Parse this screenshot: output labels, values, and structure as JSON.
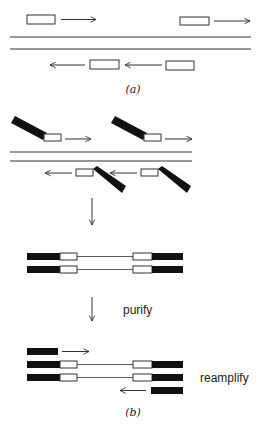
{
  "figure": {
    "panel_a": {
      "label": "(a)",
      "description": "Primers (open boxes) with arrows annealing to both strands of double-stranded DNA"
    },
    "panel_b": {
      "label": "(b)",
      "step_purify": "purify",
      "step_reamplify": "reamplify",
      "description": "Tailed primers (open box with black tail) anneal, product purified, then reamplified with tail primers"
    }
  },
  "colors": {
    "stroke": "#333333",
    "tail_fill": "#111111",
    "primer_fill": "#ffffff",
    "background": "#ffffff"
  }
}
